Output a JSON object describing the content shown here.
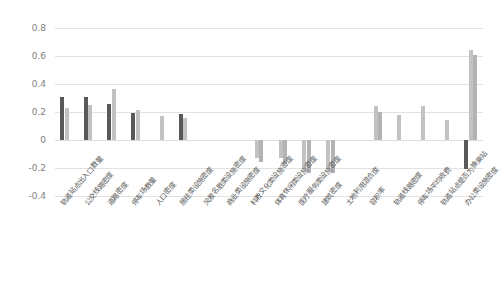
{
  "chart_data": {
    "type": "bar",
    "title": "",
    "subtitle": "",
    "xlabel": "",
    "ylabel": "",
    "ylim": [
      -0.4,
      0.8
    ],
    "yticks": [
      "0.8",
      "0.6",
      "0.4",
      "0.2",
      "0",
      "-0.2",
      "-0.4"
    ],
    "ytick_values": [
      0.8,
      0.6,
      0.4,
      0.2,
      0,
      -0.2,
      -0.4
    ],
    "grid": true,
    "legend": "none",
    "orientation": "vertical",
    "categories": [
      "轨道站点出入口数量",
      "公交线路密度",
      "道路密度",
      "停车场数量",
      "人口密度",
      "居住类设施密度",
      "风景名胜类设施密度",
      "商业类设施密度",
      "科教文化类设施密度",
      "体育休闲类设施密度",
      "医疗服务类设施密度",
      "建筑密度",
      "土地利用混合度",
      "容积率",
      "轨道线路密度",
      "停车场平均收费",
      "轨道站点是否为换乘站",
      "办公类设施密度"
    ],
    "series": [
      {
        "name": "series-1",
        "color": "#595959",
        "values": [
          0.31,
          0.31,
          0.255,
          0.19,
          0.0,
          0.185,
          0.0,
          0.0,
          0.0,
          0.0,
          0.0,
          0.0,
          0.0,
          0.0,
          0.0,
          0.0,
          0.0,
          -0.21
        ]
      },
      {
        "name": "series-2",
        "color": "#c2c2c2",
        "values": [
          0.23,
          0.25,
          0.365,
          0.215,
          0.17,
          0.155,
          0.0,
          0.0,
          -0.13,
          -0.13,
          -0.2,
          -0.205,
          0.0,
          0.24,
          0.18,
          0.24,
          0.145,
          0.645
        ]
      },
      {
        "name": "series-3",
        "color": "#b3b3b3",
        "values": [
          0.0,
          0.0,
          0.0,
          0.0,
          0.0,
          0.0,
          0.0,
          0.0,
          -0.155,
          -0.17,
          -0.235,
          -0.235,
          0.0,
          0.2,
          0.0,
          0.0,
          0.0,
          0.61
        ]
      }
    ],
    "series3_extra": {
      "note": "third drawn column present in several groups"
    }
  },
  "colors": {
    "dark_bar": "#595959",
    "light_bar": "#c2c2c2",
    "mid_bar": "#b3b3b3",
    "gridline": "#e2e2e2",
    "zero_line": "#dcdcdc",
    "axis_text": "#808080",
    "category_text": "#5a5a5a",
    "background": "#ffffff"
  }
}
